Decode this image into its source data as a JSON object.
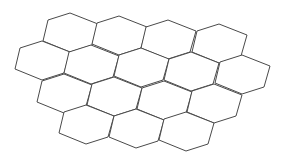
{
  "diagram": {
    "type": "hexagonal-grid",
    "background": "#ffffff",
    "stroke_color": "#4a4a4a",
    "hex_shape_offsets_from_top": [
      [
        0,
        0
      ],
      [
        28,
        11
      ],
      [
        22,
        32
      ],
      [
        0,
        39
      ],
      [
        -27,
        28
      ],
      [
        -22,
        7
      ]
    ],
    "rows": [
      {
        "tops": [
          [
            70,
            13
          ],
          [
            119,
            16
          ],
          [
            168,
            20
          ],
          [
            219,
            24
          ]
        ]
      },
      {
        "tops": [
          [
            42,
            41
          ],
          [
            91,
            45
          ],
          [
            141,
            48
          ],
          [
            191,
            52
          ],
          [
            242,
            55
          ]
        ]
      },
      {
        "tops": [
          [
            64,
            74
          ],
          [
            114,
            77
          ],
          [
            164,
            81
          ],
          [
            214,
            84
          ]
        ]
      },
      {
        "tops": [
          [
            86,
            105
          ],
          [
            136,
            109
          ],
          [
            186,
            112
          ]
        ]
      }
    ]
  }
}
